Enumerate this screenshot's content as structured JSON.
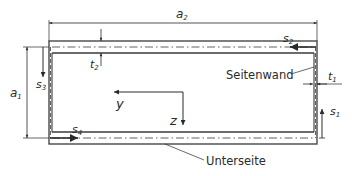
{
  "diagram": {
    "type": "hollow rectangular box-beam cross-section",
    "colors": {
      "stroke": "#3a3a3a",
      "fill": "#ffffff",
      "text": "#2a2a2a"
    },
    "dimensions": {
      "a2": {
        "symbol": "a",
        "sub": "2",
        "meaning": "overall width"
      },
      "a1": {
        "symbol": "a",
        "sub": "1",
        "meaning": "overall height"
      },
      "t1": {
        "symbol": "t",
        "sub": "1",
        "meaning": "side wall thickness"
      },
      "t2": {
        "symbol": "t",
        "sub": "2",
        "meaning": "top/bottom wall thickness"
      }
    },
    "path_coordinates": {
      "s1": {
        "symbol": "s",
        "sub": "1",
        "direction": "up"
      },
      "s2": {
        "symbol": "s",
        "sub": "2",
        "direction": "left"
      },
      "s3": {
        "symbol": "s",
        "sub": "3",
        "direction": "down"
      },
      "s4": {
        "symbol": "s",
        "sub": "4",
        "direction": "right"
      }
    },
    "axes": {
      "y": {
        "label": "y",
        "direction": "left"
      },
      "z": {
        "label": "z",
        "direction": "down"
      }
    },
    "annotations": {
      "side_wall": "Seitenwand",
      "bottom_side": "Unterseite"
    }
  }
}
